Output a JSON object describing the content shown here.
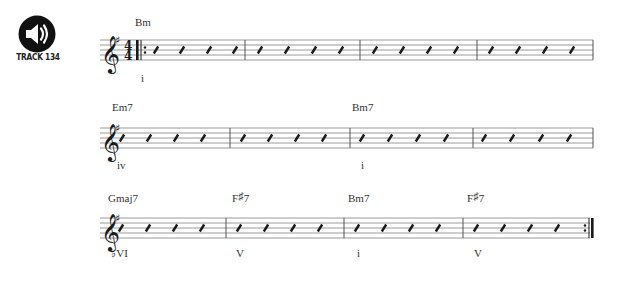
{
  "track": {
    "icon": "speaker-icon",
    "label": "TRACK 134"
  },
  "key_signature": "G major / E minor (1 sharp: F#)",
  "time_signature": {
    "top": "4",
    "bottom": "4"
  },
  "systems": [
    {
      "staff_y": 40,
      "barlines": [
        245,
        360,
        477,
        593
      ],
      "start_repeat": true,
      "end_repeat": false,
      "show_time_signature": true,
      "measures_slash_x": [
        [
          156,
          182,
          209,
          235
        ],
        [
          260,
          287,
          314,
          341
        ],
        [
          375,
          402,
          429,
          456
        ],
        [
          491,
          518,
          545,
          572
        ]
      ],
      "chords": [
        {
          "label": "Bm",
          "x": 135,
          "y": 16
        }
      ],
      "numerals": [
        {
          "label": "i",
          "x": 141,
          "y": 72
        }
      ]
    },
    {
      "staff_y": 128,
      "barlines": [
        230,
        350,
        473,
        593
      ],
      "start_repeat": false,
      "end_repeat": false,
      "show_time_signature": false,
      "measures_slash_x": [
        [
          122,
          149,
          176,
          203
        ],
        [
          243,
          270,
          297,
          324
        ],
        [
          362,
          390,
          418,
          446
        ],
        [
          484,
          512,
          541,
          569
        ]
      ],
      "chords": [
        {
          "label": "Em7",
          "x": 112,
          "y": 101
        },
        {
          "label": "Bm7",
          "x": 352,
          "y": 101
        }
      ],
      "numerals": [
        {
          "label": "iv",
          "x": 117,
          "y": 159
        },
        {
          "label": "i",
          "x": 361,
          "y": 159
        }
      ]
    },
    {
      "staff_y": 218,
      "barlines": [
        226,
        344,
        463,
        590
      ],
      "start_repeat": false,
      "end_repeat": true,
      "show_time_signature": false,
      "measures_slash_x": [
        [
          121,
          148,
          175,
          202
        ],
        [
          239,
          266,
          293,
          320
        ],
        [
          357,
          384,
          411,
          438
        ],
        [
          476,
          503,
          530,
          557
        ]
      ],
      "chords": [
        {
          "label": "Gmaj7",
          "x": 108,
          "y": 192
        },
        {
          "label": "F",
          "accidental": "♯",
          "suffix": "7",
          "x": 232,
          "y": 192
        },
        {
          "label": "Bm7",
          "x": 348,
          "y": 192
        },
        {
          "label": "F",
          "accidental": "♯",
          "suffix": "7",
          "x": 467,
          "y": 192
        }
      ],
      "numerals": [
        {
          "label": "♭VI",
          "x": 111,
          "y": 247
        },
        {
          "label": "V",
          "x": 236,
          "y": 247
        },
        {
          "label": "i",
          "x": 357,
          "y": 247
        },
        {
          "label": "V",
          "x": 474,
          "y": 247
        }
      ]
    }
  ],
  "colors": {
    "staff_line": "#9a9a9a",
    "barline": "#555555",
    "ink": "#1a1a1a",
    "icon_bg": "#111111",
    "icon_fg": "#ffffff"
  }
}
